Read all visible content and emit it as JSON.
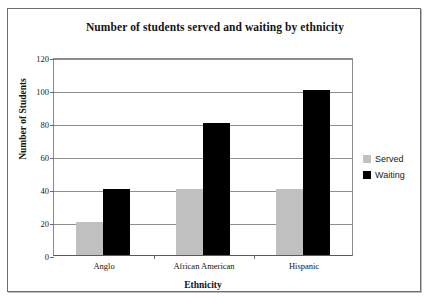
{
  "chart_data": {
    "type": "bar",
    "title": "Number of students served and waiting by ethnicity",
    "xlabel": "Ethnicity",
    "ylabel": "Number of Students",
    "categories": [
      "Anglo",
      "African American",
      "Hispanic"
    ],
    "series": [
      {
        "name": "Served",
        "color": "#c0c0c0",
        "values": [
          20,
          40,
          40
        ]
      },
      {
        "name": "Waiting",
        "color": "#000000",
        "values": [
          40,
          80,
          100
        ]
      }
    ],
    "ylim": [
      0,
      120
    ],
    "yticks": [
      0,
      20,
      40,
      60,
      80,
      100,
      120
    ],
    "ytick_labels": [
      "0",
      "20",
      "40",
      "60",
      "80",
      "100",
      "120"
    ],
    "grid": true,
    "legend_position": "right"
  },
  "legend": {
    "items": [
      {
        "label": "Served",
        "color": "#c0c0c0"
      },
      {
        "label": "Waiting",
        "color": "#000000"
      }
    ]
  }
}
